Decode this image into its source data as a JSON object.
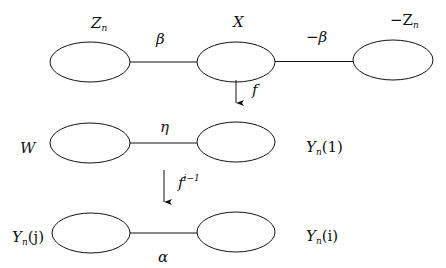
{
  "diagram": {
    "nodes": [
      {
        "id": "Zn",
        "label": "Z",
        "sub": "n",
        "cx": 89,
        "cy": 62
      },
      {
        "id": "X",
        "label": "X",
        "cx": 236,
        "cy": 62
      },
      {
        "id": "negZn",
        "label": "−Z",
        "sub": "n",
        "cx": 392,
        "cy": 60
      },
      {
        "id": "W",
        "label": "W",
        "cx": 90,
        "cy": 143
      },
      {
        "id": "Yn1",
        "label": "Y",
        "sub": "n",
        "suffix": "(1)",
        "cx": 236,
        "cy": 143
      },
      {
        "id": "Ynj",
        "label": "Y",
        "sub": "n",
        "suffix": "(j)",
        "cx": 90,
        "cy": 232
      },
      {
        "id": "Yni",
        "label": "Y",
        "sub": "n",
        "suffix": "(i)",
        "cx": 236,
        "cy": 232
      }
    ],
    "edges": [
      {
        "from": "Zn",
        "to": "X",
        "label": "β"
      },
      {
        "from": "X",
        "to": "negZn",
        "label": "−β"
      },
      {
        "from": "W",
        "to": "Yn1",
        "label": "η"
      },
      {
        "from": "Ynj",
        "to": "Yni",
        "label": "α"
      }
    ],
    "arrows": [
      {
        "label": "f",
        "sup": ""
      },
      {
        "label": "f",
        "sup": "i−1"
      }
    ],
    "labels": {
      "Zn": {
        "base": "Z",
        "sub": "n"
      },
      "X": "X",
      "negZn": {
        "base": "−Z",
        "sub": "n"
      },
      "beta": "β",
      "neg_beta": "−β",
      "f": "f",
      "W": "W",
      "eta": "η",
      "Yn1": {
        "base": "Y",
        "sub": "n",
        "suffix": "(1)"
      },
      "fi1": {
        "base": "f",
        "sup": "i−1"
      },
      "Ynj": {
        "base": "Y",
        "sub": "n",
        "suffix": "(j)"
      },
      "Yni": {
        "base": "Y",
        "sub": "n",
        "suffix": "(i)"
      },
      "alpha": "α"
    }
  }
}
